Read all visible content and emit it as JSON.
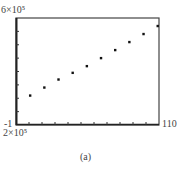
{
  "chart_data": {
    "type": "scatter",
    "title": "",
    "caption": "(a)",
    "xlabel": "",
    "ylabel": "",
    "x_tick_labels": {
      "left": "-1",
      "right": "110"
    },
    "y_tick_labels": {
      "top": "6×10⁵",
      "bottom": "2×10⁵"
    },
    "xlim": [
      -1,
      110
    ],
    "ylim": [
      200000,
      600000
    ],
    "grid": false,
    "legend": null,
    "series": [
      {
        "name": "data",
        "marker": "dot",
        "x": [
          10,
          21,
          32,
          43,
          54,
          65,
          76,
          87,
          98,
          109
        ],
        "y": [
          310000,
          340000,
          370000,
          395000,
          420000,
          450000,
          480000,
          510000,
          540000,
          570000
        ]
      }
    ],
    "colors": {
      "marker": "#111111",
      "axis": "#444444"
    }
  },
  "labels": {
    "y_top": "6×10⁵",
    "y_bottom": "2×10⁵",
    "x_left": "-1",
    "x_right": "110",
    "caption": "(a)"
  }
}
